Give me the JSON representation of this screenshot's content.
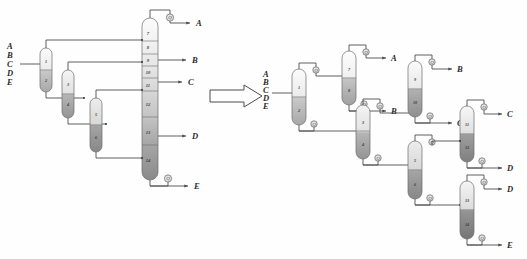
{
  "figure": {
    "feed_components": [
      "A",
      "B",
      "C",
      "D",
      "E"
    ],
    "transition_arrow": "transform-arrow"
  },
  "colors": {
    "line": "#4e4e4e",
    "vessel_stroke": "#6b6b6b",
    "lightest": "#fbfbfb",
    "darkest": "#6f6f6f",
    "exchanger_fill": "#e4e4e4",
    "label_text": "#2b2b2b"
  },
  "left_diagram": {
    "name": "thermally-coupled-arrangement",
    "feed_label_lines": [
      "A",
      "B",
      "C",
      "D",
      "E"
    ],
    "prefractionator_columns": [
      {
        "id": "col-1-2",
        "top_segment": "1",
        "bottom_segment": "2"
      },
      {
        "id": "col-3-4",
        "top_segment": "3",
        "bottom_segment": "4"
      },
      {
        "id": "col-5-6",
        "top_segment": "5",
        "bottom_segment": "6"
      }
    ],
    "main_column": {
      "id": "main-column",
      "segments": [
        "7",
        "8",
        "9",
        "10",
        "11",
        "12",
        "13",
        "14"
      ]
    },
    "products": [
      "A",
      "B",
      "C",
      "D",
      "E"
    ],
    "condenser": "condenser-icon",
    "reboiler": "reboiler-icon"
  },
  "right_diagram": {
    "name": "conventional-sequence-tree",
    "feed_label_lines": [
      "A",
      "B",
      "C",
      "D",
      "E"
    ],
    "columns": [
      {
        "id": "col-1-2",
        "top_segment": "1",
        "bottom_segment": "2",
        "product": ""
      },
      {
        "id": "col-7-8",
        "top_segment": "7",
        "bottom_segment": "8",
        "product": "A"
      },
      {
        "id": "col-3-4",
        "top_segment": "3",
        "bottom_segment": "4",
        "product": "B"
      },
      {
        "id": "col-9-10",
        "top_segment": "9",
        "bottom_segment": "10",
        "product": "B"
      },
      {
        "id": "col-11-12",
        "top_segment": "11",
        "bottom_segment": "12",
        "product": "C"
      },
      {
        "id": "col-5-6",
        "top_segment": "5",
        "bottom_segment": "6",
        "product": "D"
      },
      {
        "id": "col-13-14",
        "top_segment": "13",
        "bottom_segment": "14",
        "product": "E"
      }
    ],
    "products": [
      "A",
      "B",
      "C",
      "C",
      "D",
      "D",
      "E"
    ]
  }
}
